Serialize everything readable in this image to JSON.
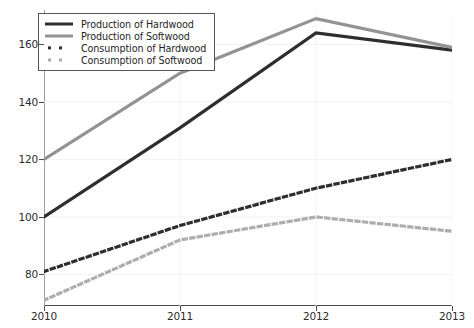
{
  "chart_data": {
    "type": "line",
    "title": "",
    "xlabel": "",
    "ylabel": "",
    "x": [
      2010,
      2011,
      2012,
      2013
    ],
    "categories": [
      "2010",
      "2011",
      "2012",
      "2013"
    ],
    "xtick_labels": [
      "2010",
      "2011",
      "2012",
      "2013"
    ],
    "ytick_labels": [
      "80",
      "100",
      "120",
      "140",
      "160"
    ],
    "ytick_values": [
      80,
      100,
      120,
      140,
      160
    ],
    "xlim": [
      2010,
      2013
    ],
    "ylim": [
      69,
      172
    ],
    "grid": true,
    "grid_style": "faint light gray vertical and horizontal gridlines",
    "legend_position": "upper left",
    "series": [
      {
        "name": "Production of Hardwood",
        "style": "solid",
        "color": "#2e2e2e",
        "linewidth": 3.2,
        "values": [
          100,
          131,
          164,
          158
        ]
      },
      {
        "name": "Production of Softwood",
        "style": "solid",
        "color": "#939393",
        "linewidth": 3.2,
        "values": [
          120,
          150,
          169,
          159
        ]
      },
      {
        "name": "Consumption of Hardwood",
        "style": "dotted",
        "color": "#2e2e2e",
        "linewidth": 3.2,
        "values": [
          81,
          97,
          110,
          120
        ]
      },
      {
        "name": "Consumption of Softwood",
        "style": "dotted",
        "color": "#adadad",
        "linewidth": 3.2,
        "values": [
          71,
          92,
          100,
          95
        ]
      }
    ]
  },
  "legend": {
    "items": [
      {
        "label": "Production of Hardwood",
        "marker": "solid-line",
        "color": "#2e2e2e"
      },
      {
        "label": "Production of Softwood",
        "marker": "solid-line",
        "color": "#939393"
      },
      {
        "label": "Consumption of Hardwood",
        "marker": "dotted-line",
        "color": "#2e2e2e"
      },
      {
        "label": "Consumption of Softwood",
        "marker": "dotted-line",
        "color": "#adadad"
      }
    ]
  },
  "axes": {
    "y_ticks": [
      "160",
      "140",
      "120",
      "100",
      "80"
    ],
    "x_ticks": [
      "2010",
      "2011",
      "2012",
      "2013"
    ]
  }
}
